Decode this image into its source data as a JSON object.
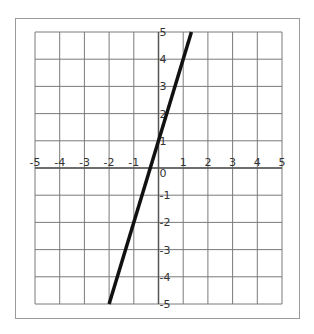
{
  "chart_data": {
    "type": "line",
    "title": "",
    "xlabel": "",
    "ylabel": "",
    "xlim": [
      -5,
      5
    ],
    "ylim": [
      -5,
      5
    ],
    "grid": true,
    "x_ticks": [
      -5,
      -4,
      -3,
      -2,
      -1,
      0,
      1,
      2,
      3,
      4,
      5
    ],
    "y_ticks": [
      -5,
      -4,
      -3,
      -2,
      -1,
      0,
      1,
      2,
      3,
      4,
      5
    ],
    "x_tick_labels": [
      "-5",
      "-4",
      "-3",
      "-2",
      "-1",
      "0",
      "1",
      "2",
      "3",
      "4",
      "5"
    ],
    "y_tick_labels": [
      "-5",
      "-4",
      "-3",
      "-2",
      "-1",
      "0",
      "1",
      "2",
      "3",
      "4",
      "5"
    ],
    "series": [
      {
        "name": "y = 3x + 1",
        "x": [
          -2,
          1.333
        ],
        "y": [
          -5,
          5
        ],
        "color": "#111111"
      }
    ],
    "legend": null
  },
  "colors": {
    "grid": "#7a7a7a",
    "axis": "#555555",
    "line": "#111111",
    "frame": "#9a9a9a"
  }
}
